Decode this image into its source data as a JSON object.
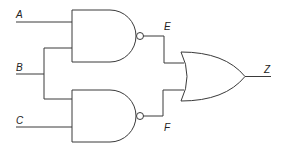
{
  "diagram": {
    "type": "logic-circuit",
    "inputs": [
      {
        "id": "A",
        "label": "A"
      },
      {
        "id": "B",
        "label": "B"
      },
      {
        "id": "C",
        "label": "C"
      }
    ],
    "intermediate": [
      {
        "id": "E",
        "label": "E"
      },
      {
        "id": "F",
        "label": "F"
      }
    ],
    "output": {
      "id": "Z",
      "label": "Z"
    },
    "gates": [
      {
        "id": "nand-top",
        "type": "NAND",
        "inputs": [
          "A",
          "B"
        ],
        "output": "E"
      },
      {
        "id": "nand-bottom",
        "type": "NAND",
        "inputs": [
          "B",
          "C"
        ],
        "output": "F"
      },
      {
        "id": "or",
        "type": "OR",
        "inputs": [
          "E",
          "F"
        ],
        "output": "Z"
      }
    ],
    "colors": {
      "line": "#3a3a3a",
      "text": "#222222",
      "background": "#ffffff"
    }
  }
}
